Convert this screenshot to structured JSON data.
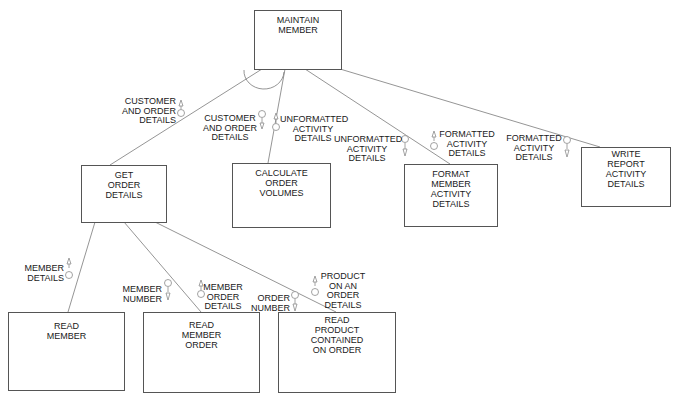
{
  "diagram": {
    "type": "structure-chart",
    "modules": {
      "maintain_member": [
        "MAINTAIN",
        "MEMBER"
      ],
      "get_order_details": [
        "GET",
        "ORDER",
        "DETAILS"
      ],
      "calculate_order_volumes": [
        "CALCULATE",
        "ORDER",
        "VOLUMES"
      ],
      "format_member_activity_details": [
        "FORMAT",
        "MEMBER",
        "ACTIVITY",
        "DETAILS"
      ],
      "write_report_activity_details": [
        "WRITE",
        "REPORT",
        "ACTIVITY",
        "DETAILS"
      ],
      "read_member": [
        "READ",
        "MEMBER"
      ],
      "read_member_order": [
        "READ",
        "MEMBER",
        "ORDER"
      ],
      "read_product_contained_on_order": [
        "READ",
        "PRODUCT",
        "CONTAINED",
        "ON ORDER"
      ]
    },
    "couples": {
      "c1": [
        "CUSTOMER",
        "AND ORDER",
        "DETAILS"
      ],
      "c2": [
        "CUSTOMER",
        "AND ORDER",
        "DETAILS"
      ],
      "c3": [
        "UNFORMATTED",
        "ACTIVITY",
        "DETAILS"
      ],
      "c4": [
        "UNFORMATTED",
        "ACTIVITY",
        "DETAILS"
      ],
      "c5": [
        "FORMATTED",
        "ACTIVITY",
        "DETAILS"
      ],
      "c6": [
        "FORMATTED",
        "ACTIVITY",
        "DETAILS"
      ],
      "c7": [
        "MEMBER",
        "DETAILS"
      ],
      "c8": [
        "MEMBER",
        "NUMBER"
      ],
      "c9": [
        "MEMBER",
        "ORDER",
        "DETAILS"
      ],
      "c10": [
        "ORDER",
        "NUMBER"
      ],
      "c11": [
        "PRODUCT",
        "ON AN",
        "ORDER",
        "DETAILS"
      ]
    },
    "line_color": "#777777",
    "symbol_color": "#888888"
  }
}
